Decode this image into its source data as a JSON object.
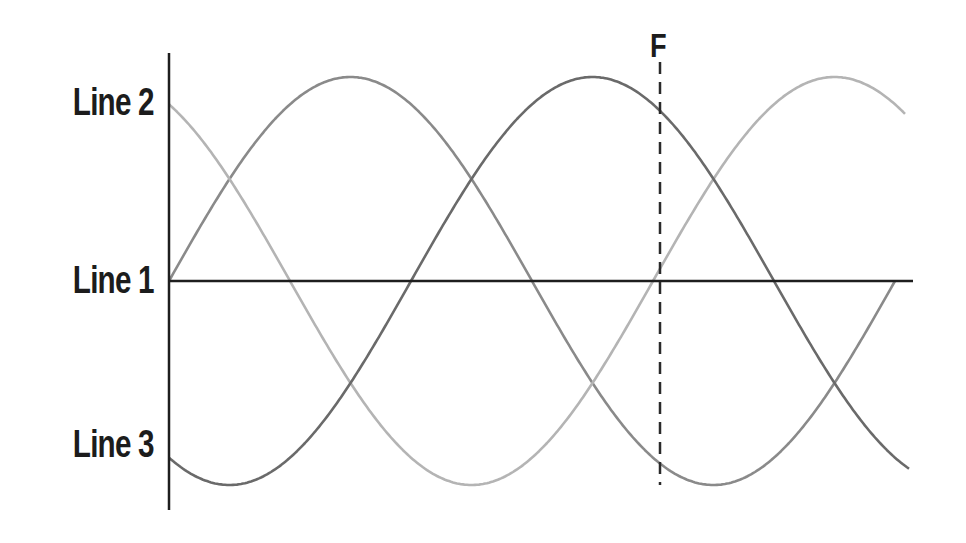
{
  "diagram": {
    "type": "three-phase waveform",
    "labels": {
      "line2": "Line 2",
      "line1": "Line 1",
      "line3": "Line 3",
      "marker": "F"
    },
    "geometry": {
      "axis_x": 169,
      "axis_top": 53,
      "axis_bottom": 510,
      "baseline_y": 281,
      "baseline_end_x": 913,
      "amplitude_px": 204,
      "period_px": 726,
      "marker_x": 660,
      "marker_top": 62,
      "marker_bottom": 485
    },
    "label_positions": {
      "line2_y": 103,
      "line1_y": 281,
      "line3_y": 445
    },
    "waves": [
      {
        "name": "wave-a",
        "phase_deg": 0,
        "x_end": 895,
        "color": "#8a8a8a"
      },
      {
        "name": "wave-b",
        "phase_deg": 120,
        "x_end": 905,
        "color": "#b4b4b4"
      },
      {
        "name": "wave-c",
        "phase_deg": -120,
        "x_end": 910,
        "color": "#6a6a6a"
      }
    ],
    "colors": {
      "axis": "#1e1e1e",
      "text": "#1c1c1c",
      "marker_line": "#2a2a2a"
    }
  }
}
